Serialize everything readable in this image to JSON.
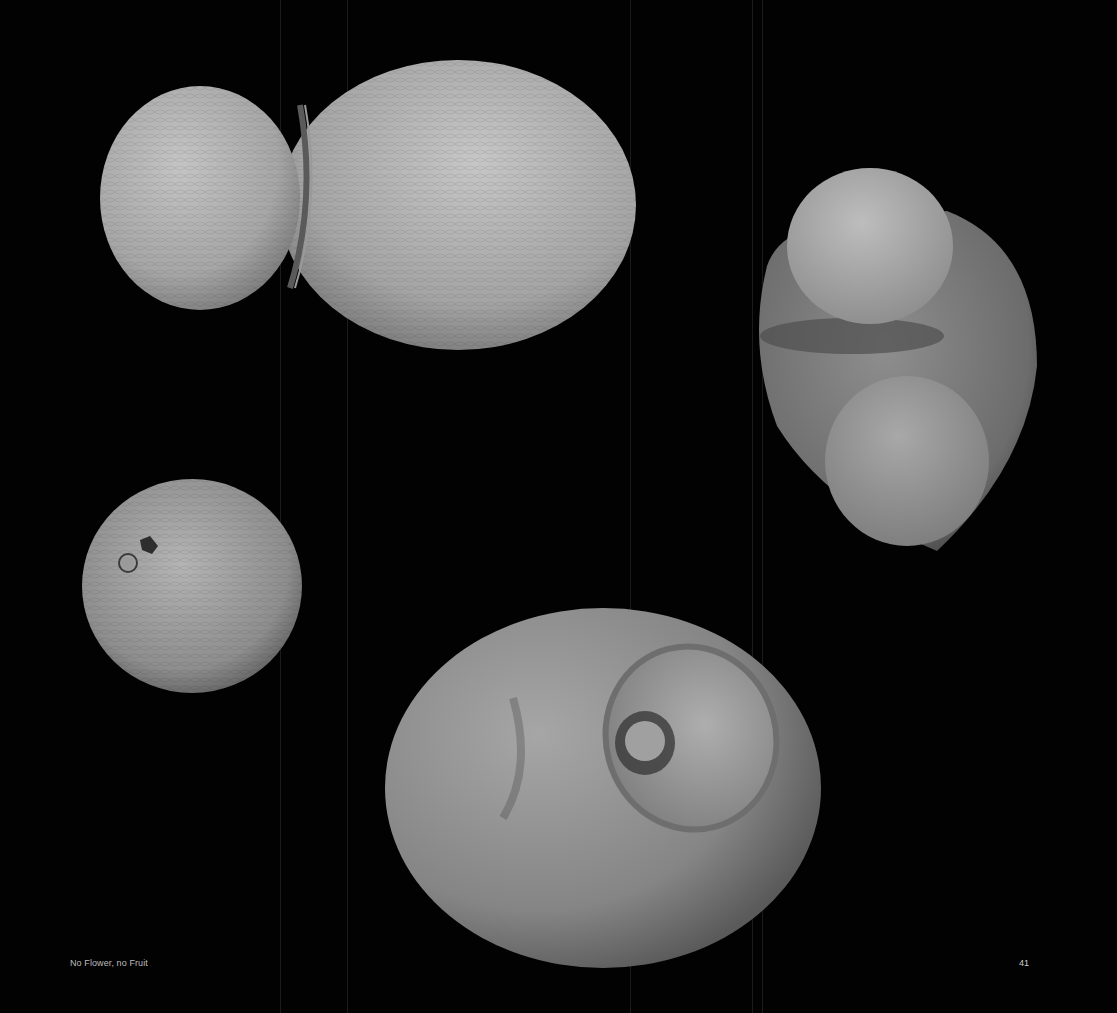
{
  "page": {
    "background": "#020202",
    "footer": {
      "title": "No Flower, no Fruit",
      "page_number": "41"
    }
  },
  "figures": [
    {
      "name": "specimen-top-left",
      "description": "Two-lobed elongated seed with joint ring, SEM micrograph"
    },
    {
      "name": "specimen-top-right",
      "description": "Rounded seed with cap and lobed base, SEM micrograph"
    },
    {
      "name": "specimen-middle-left",
      "description": "Small round seed with hilum scar, SEM micrograph"
    },
    {
      "name": "specimen-bottom-center",
      "description": "Large ovoid seed with cup-shaped opening, SEM micrograph"
    }
  ]
}
